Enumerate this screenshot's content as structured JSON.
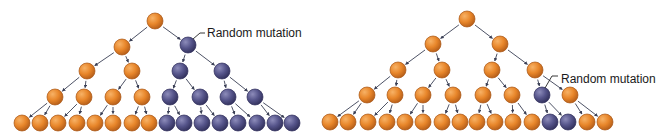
{
  "colors": {
    "original": "#e8862a",
    "original_dark": "#a85514",
    "mutant": "#55548a",
    "mutant_dark": "#2e2d5a",
    "arrow": "#3a3f55"
  },
  "trees": [
    {
      "id": "left",
      "mutation_label": "Random mutation",
      "label_pos": [
        207,
        33
      ],
      "leader": [
        [
          193,
          39
        ],
        [
          200,
          33
        ],
        [
          205,
          33
        ]
      ],
      "nodes": [
        {
          "id": "r",
          "x": 155,
          "y": 21,
          "type": "original"
        },
        {
          "id": "a",
          "x": 122,
          "y": 47,
          "type": "original",
          "parent": "r"
        },
        {
          "id": "b",
          "x": 188,
          "y": 45,
          "type": "mutant",
          "parent": "r"
        },
        {
          "id": "a1",
          "x": 87,
          "y": 71,
          "type": "original",
          "parent": "a"
        },
        {
          "id": "a2",
          "x": 132,
          "y": 71,
          "type": "original",
          "parent": "a"
        },
        {
          "id": "b1",
          "x": 180,
          "y": 71,
          "type": "mutant",
          "parent": "b"
        },
        {
          "id": "b2",
          "x": 222,
          "y": 71,
          "type": "mutant",
          "parent": "b"
        },
        {
          "id": "c1",
          "x": 55,
          "y": 97,
          "type": "original",
          "parent": "a1"
        },
        {
          "id": "c2",
          "x": 84,
          "y": 97,
          "type": "original",
          "parent": "a1"
        },
        {
          "id": "c3",
          "x": 113,
          "y": 97,
          "type": "original",
          "parent": "a2"
        },
        {
          "id": "c4",
          "x": 142,
          "y": 97,
          "type": "original",
          "parent": "a2"
        },
        {
          "id": "c5",
          "x": 170,
          "y": 97,
          "type": "mutant",
          "parent": "b1"
        },
        {
          "id": "c6",
          "x": 200,
          "y": 97,
          "type": "mutant",
          "parent": "b1"
        },
        {
          "id": "c7",
          "x": 228,
          "y": 97,
          "type": "mutant",
          "parent": "b2"
        },
        {
          "id": "c8",
          "x": 255,
          "y": 97,
          "type": "mutant",
          "parent": "b2"
        },
        {
          "id": "d1",
          "x": 22,
          "y": 123,
          "type": "original",
          "parent": "c1"
        },
        {
          "id": "d2",
          "x": 40,
          "y": 123,
          "type": "original",
          "parent": "c1"
        },
        {
          "id": "d3",
          "x": 58,
          "y": 123,
          "type": "original",
          "parent": "c2"
        },
        {
          "id": "d4",
          "x": 77,
          "y": 123,
          "type": "original",
          "parent": "c2"
        },
        {
          "id": "d5",
          "x": 95,
          "y": 123,
          "type": "original",
          "parent": "c3"
        },
        {
          "id": "d6",
          "x": 113,
          "y": 123,
          "type": "original",
          "parent": "c3"
        },
        {
          "id": "d7",
          "x": 132,
          "y": 123,
          "type": "original",
          "parent": "c4"
        },
        {
          "id": "d8",
          "x": 149,
          "y": 123,
          "type": "original",
          "parent": "c4"
        },
        {
          "id": "d9",
          "x": 167,
          "y": 123,
          "type": "mutant",
          "parent": "c5"
        },
        {
          "id": "d10",
          "x": 184,
          "y": 123,
          "type": "mutant",
          "parent": "c5"
        },
        {
          "id": "d11",
          "x": 202,
          "y": 123,
          "type": "mutant",
          "parent": "c6"
        },
        {
          "id": "d12",
          "x": 220,
          "y": 123,
          "type": "mutant",
          "parent": "c6"
        },
        {
          "id": "d13",
          "x": 238,
          "y": 123,
          "type": "mutant",
          "parent": "c7"
        },
        {
          "id": "d14",
          "x": 257,
          "y": 123,
          "type": "mutant",
          "parent": "c7"
        },
        {
          "id": "d15",
          "x": 275,
          "y": 123,
          "type": "mutant",
          "parent": "c8"
        },
        {
          "id": "d16",
          "x": 292,
          "y": 123,
          "type": "mutant",
          "parent": "c8"
        }
      ]
    },
    {
      "id": "right",
      "mutation_label": "Random mutation",
      "label_pos": [
        561,
        79
      ],
      "leader": [
        [
          545,
          88
        ],
        [
          552,
          76
        ],
        [
          558,
          76
        ]
      ],
      "nodes": [
        {
          "id": "r",
          "x": 467,
          "y": 19,
          "type": "original"
        },
        {
          "id": "a",
          "x": 433,
          "y": 44,
          "type": "original",
          "parent": "r"
        },
        {
          "id": "b",
          "x": 500,
          "y": 44,
          "type": "original",
          "parent": "r"
        },
        {
          "id": "a1",
          "x": 398,
          "y": 70,
          "type": "original",
          "parent": "a"
        },
        {
          "id": "a2",
          "x": 442,
          "y": 70,
          "type": "original",
          "parent": "a"
        },
        {
          "id": "b1",
          "x": 492,
          "y": 70,
          "type": "original",
          "parent": "b"
        },
        {
          "id": "b2",
          "x": 535,
          "y": 70,
          "type": "original",
          "parent": "b"
        },
        {
          "id": "c1",
          "x": 367,
          "y": 95,
          "type": "original",
          "parent": "a1"
        },
        {
          "id": "c2",
          "x": 395,
          "y": 95,
          "type": "original",
          "parent": "a1"
        },
        {
          "id": "c3",
          "x": 423,
          "y": 95,
          "type": "original",
          "parent": "a2"
        },
        {
          "id": "c4",
          "x": 453,
          "y": 95,
          "type": "original",
          "parent": "a2"
        },
        {
          "id": "c5",
          "x": 483,
          "y": 95,
          "type": "original",
          "parent": "b1"
        },
        {
          "id": "c6",
          "x": 512,
          "y": 95,
          "type": "original",
          "parent": "b1"
        },
        {
          "id": "c7",
          "x": 542,
          "y": 95,
          "type": "mutant",
          "parent": "b2"
        },
        {
          "id": "c8",
          "x": 570,
          "y": 95,
          "type": "original",
          "parent": "b2"
        },
        {
          "id": "d1",
          "x": 330,
          "y": 122,
          "type": "original",
          "parent": "c1"
        },
        {
          "id": "d2",
          "x": 348,
          "y": 122,
          "type": "original",
          "parent": "c1"
        },
        {
          "id": "d3",
          "x": 368,
          "y": 122,
          "type": "original",
          "parent": "c2"
        },
        {
          "id": "d4",
          "x": 387,
          "y": 122,
          "type": "original",
          "parent": "c2"
        },
        {
          "id": "d5",
          "x": 405,
          "y": 122,
          "type": "original",
          "parent": "c3"
        },
        {
          "id": "d6",
          "x": 423,
          "y": 122,
          "type": "original",
          "parent": "c3"
        },
        {
          "id": "d7",
          "x": 442,
          "y": 122,
          "type": "original",
          "parent": "c4"
        },
        {
          "id": "d8",
          "x": 460,
          "y": 122,
          "type": "original",
          "parent": "c4"
        },
        {
          "id": "d9",
          "x": 477,
          "y": 122,
          "type": "original",
          "parent": "c5"
        },
        {
          "id": "d10",
          "x": 495,
          "y": 122,
          "type": "original",
          "parent": "c5"
        },
        {
          "id": "d11",
          "x": 513,
          "y": 122,
          "type": "original",
          "parent": "c6"
        },
        {
          "id": "d12",
          "x": 532,
          "y": 122,
          "type": "original",
          "parent": "c6"
        },
        {
          "id": "d13",
          "x": 550,
          "y": 122,
          "type": "mutant",
          "parent": "c7"
        },
        {
          "id": "d14",
          "x": 568,
          "y": 122,
          "type": "mutant",
          "parent": "c7"
        },
        {
          "id": "d15",
          "x": 587,
          "y": 122,
          "type": "original",
          "parent": "c8"
        },
        {
          "id": "d16",
          "x": 605,
          "y": 122,
          "type": "original",
          "parent": "c8"
        }
      ]
    }
  ]
}
